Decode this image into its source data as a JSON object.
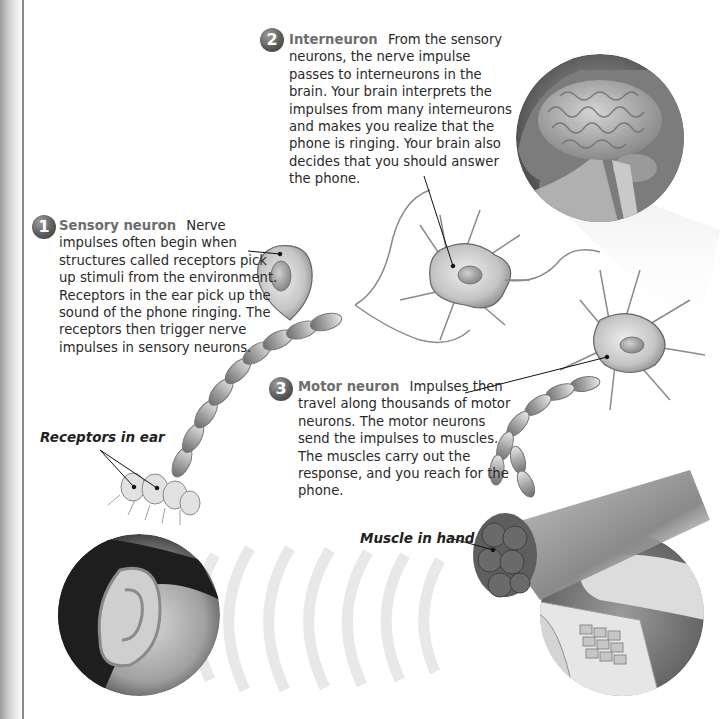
{
  "callouts": [
    {
      "number": "1",
      "title": "Sensory neuron",
      "text": "Nerve impulses often begin when structures called receptors pick up stimuli from the environment. Receptors in the ear pick up the sound of the phone ringing. The receptors then trigger nerve impulses in sensory neurons."
    },
    {
      "number": "2",
      "title": "Interneuron",
      "text": "From the sensory neurons, the nerve impulse passes to interneurons in the brain. Your brain interprets the impulses from many interneurons and makes you realize that the phone is ringing. Your brain also decides that you should answer the phone."
    },
    {
      "number": "3",
      "title": "Motor neuron",
      "text": "Impulses then travel along thousands of motor neurons. The motor neurons send the impulses to muscles. The muscles carry out the response, and you reach for the phone."
    }
  ],
  "labels": {
    "receptors": "Receptors in ear",
    "muscle": "Muscle in hand"
  },
  "illustrations": [
    "brain-in-head-inset",
    "ear-inset",
    "sound-waves",
    "hand-on-phone-inset",
    "sensory-neuron",
    "interneuron",
    "motor-neuron",
    "ear-receptors",
    "muscle-bundle"
  ]
}
